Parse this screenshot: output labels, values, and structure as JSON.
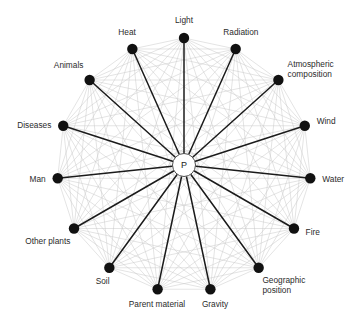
{
  "diagram": {
    "center": {
      "label": "P",
      "name": "center-node-plant"
    },
    "colors": {
      "background": "#ffffff",
      "node_fill": "#111111",
      "spoke_stroke": "#1b1b1b",
      "chord_stroke": "#c9c9c9",
      "label_text": "#2b2b2b",
      "center_fill": "#ffffff",
      "center_stroke": "#3a3a3a"
    },
    "geometry": {
      "cx": 184,
      "cy": 165,
      "radius": 127,
      "node_radius": 5.2,
      "center_radius": 11.5,
      "start_angle_deg": -90,
      "node_count": 15
    },
    "nodes": [
      {
        "id": "light",
        "label": "Light",
        "lines": [
          "Light"
        ],
        "angle_deg": -90,
        "label_anchor": "middle",
        "label_dx": 0,
        "label_dy": -12
      },
      {
        "id": "radiation",
        "label": "Radiation",
        "lines": [
          "Radiation"
        ],
        "angle_deg": -66,
        "label_anchor": "middle",
        "label_dx": 4,
        "label_dy": -11
      },
      {
        "id": "atmospheric-composition",
        "label": "Atmospheric composition",
        "lines": [
          "Atmospheric",
          "composition"
        ],
        "angle_deg": -42,
        "label_anchor": "start",
        "label_dx": 7,
        "label_dy": -11
      },
      {
        "id": "wind",
        "label": "Wind",
        "lines": [
          "Wind"
        ],
        "angle_deg": -18,
        "label_anchor": "start",
        "label_dx": 9,
        "label_dy": -1
      },
      {
        "id": "water",
        "label": "Water",
        "lines": [
          "Water"
        ],
        "angle_deg": 6,
        "label_anchor": "start",
        "label_dx": 9,
        "label_dy": 3
      },
      {
        "id": "fire",
        "label": "Fire",
        "lines": [
          "Fire"
        ],
        "angle_deg": 30,
        "label_anchor": "start",
        "label_dx": 9,
        "label_dy": 5
      },
      {
        "id": "geographic-position",
        "label": "Geographic position",
        "lines": [
          "Geographic",
          "position"
        ],
        "angle_deg": 54,
        "label_anchor": "start",
        "label_dx": 2,
        "label_dy": 13
      },
      {
        "id": "gravity",
        "label": "Gravity",
        "lines": [
          "Gravity"
        ],
        "angle_deg": 78,
        "label_anchor": "middle",
        "label_dx": 4,
        "label_dy": 15
      },
      {
        "id": "parent-material",
        "label": "Parent material",
        "lines": [
          "Parent material"
        ],
        "angle_deg": 102,
        "label_anchor": "middle",
        "label_dx": 0,
        "label_dy": 15
      },
      {
        "id": "soil",
        "label": "Soil",
        "lines": [
          "Soil"
        ],
        "angle_deg": 126,
        "label_anchor": "middle",
        "label_dx": -5,
        "label_dy": 14
      },
      {
        "id": "other-plants",
        "label": "Other plants",
        "lines": [
          "Other plants"
        ],
        "angle_deg": 150,
        "label_anchor": "end",
        "label_dx": -1,
        "label_dy": 14
      },
      {
        "id": "man",
        "label": "Man",
        "lines": [
          "Man"
        ],
        "angle_deg": 174,
        "label_anchor": "end",
        "label_dx": -9,
        "label_dy": 3
      },
      {
        "id": "diseases",
        "label": "Diseases",
        "lines": [
          "Diseases"
        ],
        "angle_deg": 198,
        "label_anchor": "end",
        "label_dx": -9,
        "label_dy": 3
      },
      {
        "id": "animals",
        "label": "Animals",
        "lines": [
          "Animals"
        ],
        "angle_deg": 222,
        "label_anchor": "end",
        "label_dx": -4,
        "label_dy": -10
      },
      {
        "id": "heat",
        "label": "Heat",
        "lines": [
          "Heat"
        ],
        "angle_deg": 246,
        "label_anchor": "middle",
        "label_dx": -4,
        "label_dy": -11
      }
    ]
  }
}
